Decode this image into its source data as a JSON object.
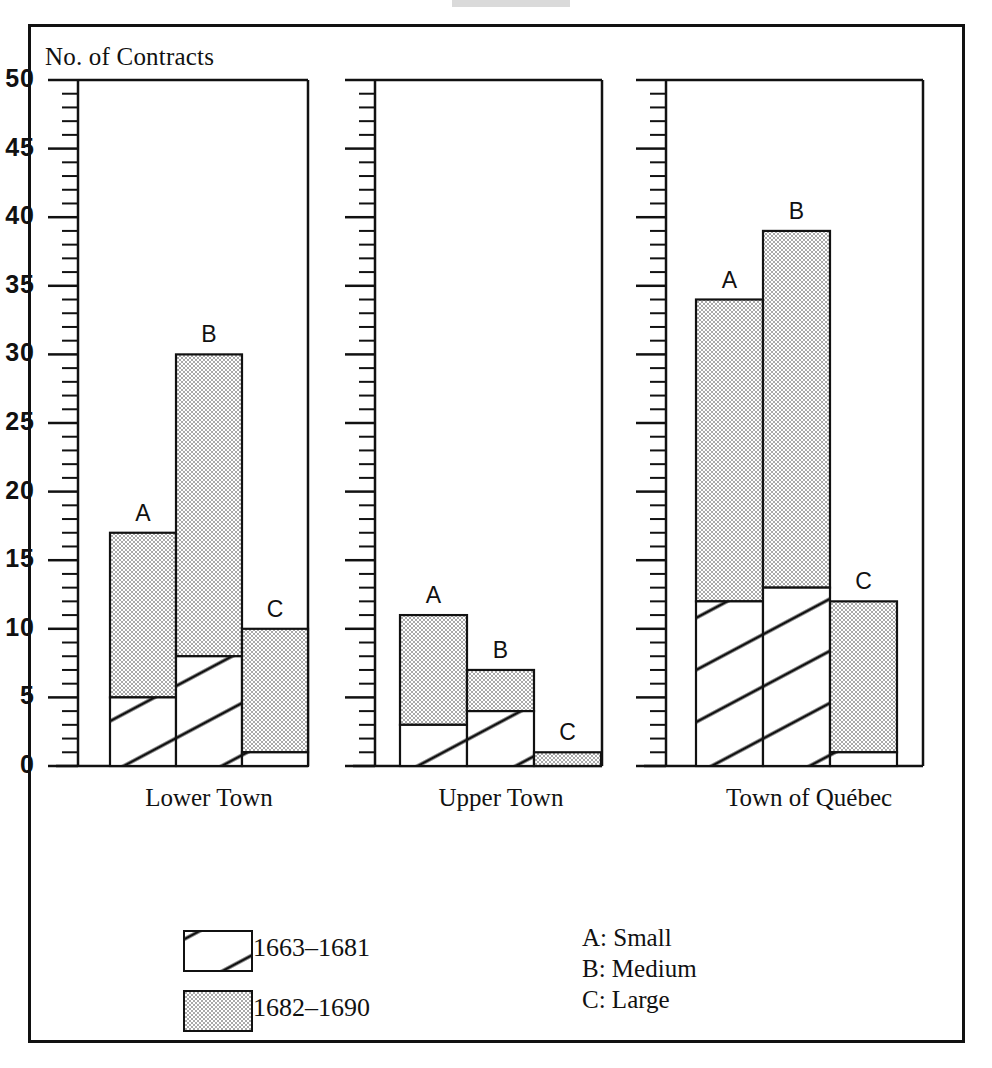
{
  "figure": {
    "y_axis_title": "No. of Contracts"
  },
  "chart_data": {
    "type": "bar",
    "title": "",
    "subtitle": "",
    "xlabel": "",
    "ylabel": "No. of Contracts",
    "ylim": [
      0,
      50
    ],
    "ytick_step": 5,
    "yminor_step": 1,
    "ytick_labels": [
      "0",
      "5",
      "10",
      "15",
      "20",
      "25",
      "30",
      "35",
      "40",
      "45",
      "50"
    ],
    "grid": false,
    "stacked": true,
    "legend_position": "bottom-left",
    "panels": [
      "Lower Town",
      "Upper Town",
      "Town of Québec"
    ],
    "categories": [
      "A",
      "B",
      "C"
    ],
    "series": [
      {
        "name": "1663–1681",
        "pattern": "hatched",
        "values": [
          [
            5,
            8,
            1
          ],
          [
            3,
            4,
            0
          ],
          [
            12,
            13,
            1
          ]
        ]
      },
      {
        "name": "1682–1690",
        "pattern": "stipple-gray",
        "values": [
          [
            12,
            22,
            9
          ],
          [
            8,
            3,
            1
          ],
          [
            22,
            26,
            11
          ]
        ]
      }
    ],
    "totals": [
      [
        17,
        30,
        10
      ],
      [
        11,
        7,
        1
      ],
      [
        34,
        39,
        12
      ]
    ]
  },
  "legend": {
    "entries": [
      {
        "label": "1663–1681",
        "pattern": "hatched"
      },
      {
        "label": "1682–1690",
        "pattern": "stipple-gray"
      }
    ],
    "key": [
      "A: Small",
      "B: Medium",
      "C: Large"
    ]
  },
  "colors": {
    "ink": "#111111",
    "paper": "#ffffff",
    "stipple_gray": "#cfcfcf"
  }
}
